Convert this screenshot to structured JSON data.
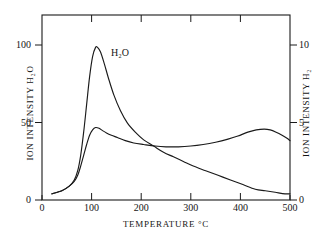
{
  "chart_data": {
    "type": "line",
    "title": "",
    "xlabel": "TEMPERATURE  °C",
    "xlabel_main": "TEMPERATURE",
    "xlabel_unit": "°C",
    "ylabel_left": "ION  INTENSITY  H₂O",
    "ylabel_right": "ION  INTENSITY  H₂",
    "xlim": [
      0,
      500
    ],
    "ylim_left": [
      0,
      120
    ],
    "ylim_right": [
      0,
      12
    ],
    "xticks": [
      0,
      100,
      200,
      300,
      400,
      500
    ],
    "xtick_labels": [
      "0",
      "100",
      "200",
      "300",
      "400",
      "500"
    ],
    "yticks_left": [
      0,
      50,
      100
    ],
    "ytick_labels_left": [
      "0",
      "50",
      "100"
    ],
    "yticks_right": [
      0,
      5,
      10
    ],
    "ytick_labels_right": [
      "0",
      "5",
      "10"
    ],
    "grid": false,
    "legend_position": "inline-annotations",
    "frame": "box",
    "tick_direction": "in-out",
    "line_color": "#1a1a1a",
    "background_color": "#ffffff",
    "series": [
      {
        "name": "H2O",
        "label": "H₂O",
        "label_text": "H",
        "label_sub": "2",
        "label_tail": "O",
        "axis": "left",
        "annotation_x": 135,
        "annotation_y": 95,
        "units": "ION INTENSITY H2O",
        "x": [
          20,
          40,
          55,
          65,
          72,
          78,
          84,
          90,
          96,
          102,
          108,
          112,
          118,
          126,
          134,
          145,
          158,
          172,
          188,
          205,
          225,
          245,
          265,
          285,
          305,
          330,
          355,
          380,
          405,
          430,
          450,
          470,
          490,
          500
        ],
        "values": [
          4,
          6,
          9,
          13,
          19,
          29,
          44,
          62,
          80,
          93,
          99,
          99,
          96,
          88,
          79,
          68,
          58,
          50,
          44,
          39,
          35,
          31,
          28,
          25,
          22,
          19,
          16,
          13,
          10,
          7,
          6,
          5,
          4,
          4
        ]
      },
      {
        "name": "H2",
        "label": "H₂",
        "label_text": "H",
        "label_sub": "2",
        "label_tail": "",
        "axis": "right",
        "annotation_x": 138,
        "annotation_y": 53,
        "units": "ION INTENSITY H2",
        "x": [
          20,
          40,
          55,
          65,
          72,
          78,
          84,
          90,
          96,
          102,
          108,
          115,
          122,
          130,
          140,
          152,
          168,
          185,
          205,
          228,
          250,
          275,
          300,
          325,
          350,
          375,
          395,
          415,
          432,
          448,
          460,
          472,
          484,
          494,
          500
        ],
        "values": [
          0.4,
          0.6,
          0.9,
          1.2,
          1.6,
          2.2,
          2.9,
          3.6,
          4.2,
          4.55,
          4.7,
          4.65,
          4.5,
          4.35,
          4.2,
          4.05,
          3.85,
          3.7,
          3.6,
          3.5,
          3.45,
          3.45,
          3.5,
          3.6,
          3.75,
          3.95,
          4.15,
          4.4,
          4.55,
          4.6,
          4.55,
          4.4,
          4.2,
          4.0,
          3.85
        ]
      }
    ],
    "annotations": [
      {
        "text": "H₂O",
        "x": 135,
        "y": 95,
        "series": "H2O"
      },
      {
        "text": "H₂",
        "x": 138,
        "y": 53,
        "series": "H2"
      }
    ]
  }
}
